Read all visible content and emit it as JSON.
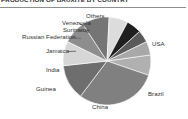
{
  "header": {
    "title": "PRODUCTION OF BAUXITE BY COUNTRY",
    "rule_color": "#8e8e8e"
  },
  "chart_data": {
    "type": "pie",
    "title": "PRODUCTION OF BAUXITE BY COUNTRY",
    "xlabel": "",
    "ylabel": "",
    "legend_position": "none",
    "labels_position": "outside",
    "grid": false,
    "categories": [
      "Others",
      "USA",
      "Brazil",
      "China",
      "Guinea",
      "India",
      "Jamaica",
      "Russian Federation",
      "Suriname",
      "Venezuela"
    ],
    "values": [
      7.5,
      30.0,
      13.0,
      9.0,
      8.5,
      10.0,
      7.0,
      5.5,
      4.5,
      5.0
    ],
    "unit": "%",
    "colors": [
      "#b0b0b0",
      "#808080",
      "#6e6e6e",
      "#d6d6d6",
      "#8d8d8d",
      "#757575",
      "#dcdcdc",
      "#1f1f1f",
      "#5a5a5a",
      "#a8a8a8"
    ],
    "start_angle_deg": -8,
    "direction": "clockwise"
  },
  "labels": {
    "others": "Others",
    "usa": "USA",
    "brazil": "Brazil",
    "china": "China",
    "guinea": "Guinea",
    "india": "India",
    "jamaica": "Jamaica",
    "russian_federation": "Russian Federation",
    "suriname": "Suriname",
    "venezuela": "Venezuela"
  }
}
